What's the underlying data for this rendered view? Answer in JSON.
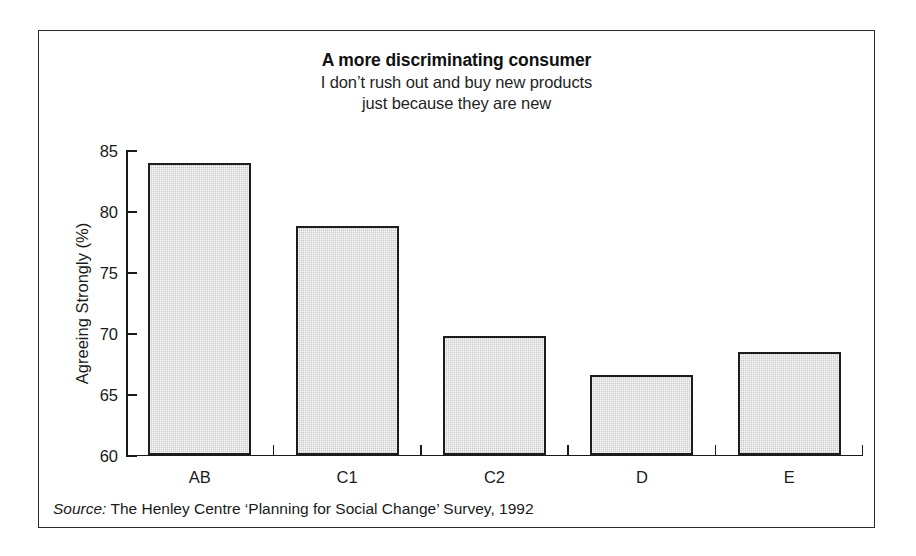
{
  "chart_data": {
    "type": "bar",
    "title": "A more discriminating consumer",
    "subtitle_lines": [
      "I don’t rush out and buy new products",
      "just because they are new"
    ],
    "categories": [
      "AB",
      "C1",
      "C2",
      "D",
      "E"
    ],
    "values": [
      83.9,
      78.7,
      69.7,
      66.5,
      68.4
    ],
    "xlabel": "",
    "ylabel": "Agreeing Strongly (%)",
    "ylim": [
      60,
      85
    ],
    "yticks": [
      60,
      65,
      70,
      75,
      80,
      85
    ],
    "ytick_labels": [
      "60",
      "65",
      "70",
      "75",
      "80",
      "85"
    ],
    "grid": false,
    "legend": null,
    "bar_fill_color": "#c9c9c9",
    "bar_edge_color": "#1d1d1d",
    "axis_color": "#1a1a1a"
  },
  "source": {
    "label": "Source:",
    "text": "The Henley Centre ‘Planning for Social Change’ Survey, 1992"
  }
}
